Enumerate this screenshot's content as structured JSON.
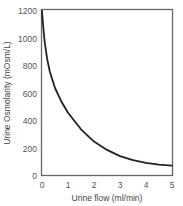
{
  "chart_data": {
    "type": "line",
    "title": "",
    "xlabel": "Urine flow (ml/min)",
    "ylabel": "Urine Osmolarity (mOsm/L)",
    "xlim": [
      0,
      5
    ],
    "ylim": [
      0,
      1200
    ],
    "xticks": [
      "0",
      "1",
      "2",
      "3",
      "4",
      "5"
    ],
    "yticks": [
      "0",
      "200",
      "400",
      "600",
      "800",
      "1000",
      "1200"
    ],
    "grid": false,
    "legend": null,
    "series": [
      {
        "name": "Urine osmolarity",
        "color": "#222222",
        "x": [
          0.0,
          0.05,
          0.1,
          0.2,
          0.3,
          0.5,
          0.75,
          1.0,
          1.5,
          2.0,
          2.5,
          3.0,
          3.5,
          4.0,
          4.5,
          5.0
        ],
        "y": [
          1200,
          1080,
          980,
          850,
          760,
          640,
          540,
          460,
          340,
          250,
          190,
          145,
          115,
          95,
          82,
          75
        ]
      }
    ]
  },
  "colors": {
    "frame": "#555555",
    "curve": "#222222",
    "background": "#ffffff"
  }
}
